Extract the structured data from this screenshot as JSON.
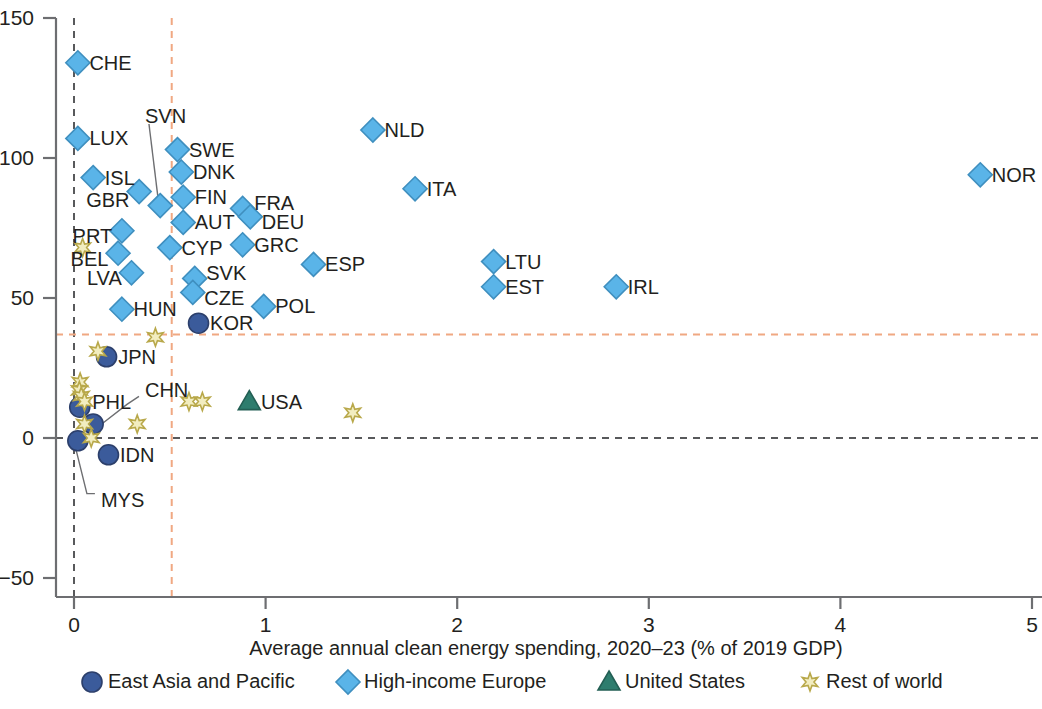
{
  "chart_data": {
    "type": "scatter",
    "title": "",
    "xlabel": "Average annual clean energy spending, 2020–23 (% of 2019 GDP)",
    "ylabel": "",
    "xlim": [
      0,
      5
    ],
    "ylim": [
      -50,
      150
    ],
    "xticks": [
      "0",
      "1",
      "2",
      "3",
      "4",
      "5"
    ],
    "xtick_values": [
      0,
      1,
      2,
      3,
      4,
      5
    ],
    "yticks": [
      "−50",
      "0",
      "50",
      "100",
      "150"
    ],
    "ytick_values": [
      -50,
      0,
      50,
      100,
      150
    ],
    "grid": false,
    "reference_lines": [
      {
        "name": "x-zero-dashed",
        "orientation": "vertical",
        "value": 0.0,
        "color": "#58595b",
        "style": "dashed"
      },
      {
        "name": "y-zero-dashed",
        "orientation": "horizontal",
        "value": 0,
        "color": "#58595b",
        "style": "dashed"
      },
      {
        "name": "x-median-dashed",
        "orientation": "vertical",
        "value": 0.51,
        "color": "#f0a882",
        "style": "dashed"
      },
      {
        "name": "y-median-dashed",
        "orientation": "horizontal",
        "value": 37,
        "color": "#f0a882",
        "style": "dashed"
      }
    ],
    "legend_position": "bottom",
    "series": [
      {
        "name": "East Asia and Pacific",
        "marker": "circle",
        "color": "#3b5b9b",
        "points": [
          {
            "label": "KOR",
            "x": 0.65,
            "y": 41,
            "lx": 0.7,
            "ly": 41,
            "anchor": "left"
          },
          {
            "label": "JPN",
            "x": 0.17,
            "y": 29,
            "lx": 0.22,
            "ly": 29,
            "anchor": "left"
          },
          {
            "label": "PHL",
            "x": 0.03,
            "y": 11,
            "lx": 0.085,
            "ly": 13,
            "anchor": "left"
          },
          {
            "label": "CHN",
            "x": 0.1,
            "y": 5,
            "lx": 0.36,
            "ly": 17,
            "anchor": "left",
            "leader": true
          },
          {
            "label": "MYS",
            "x": 0.02,
            "y": -1,
            "lx": 0.13,
            "ly": -22,
            "anchor": "left",
            "leader": true
          },
          {
            "label": "IDN",
            "x": 0.18,
            "y": -6,
            "lx": 0.23,
            "ly": -6,
            "anchor": "left"
          }
        ]
      },
      {
        "name": "High-income Europe",
        "marker": "diamond",
        "color": "#5ab4e8",
        "points": [
          {
            "label": "CHE",
            "x": 0.02,
            "y": 134,
            "lx": 0.07,
            "ly": 134,
            "anchor": "left"
          },
          {
            "label": "NOR",
            "x": 4.73,
            "y": 94,
            "lx": 4.78,
            "ly": 94,
            "anchor": "left"
          },
          {
            "label": "NLD",
            "x": 1.56,
            "y": 110,
            "lx": 1.61,
            "ly": 110,
            "anchor": "left"
          },
          {
            "label": "LUX",
            "x": 0.02,
            "y": 107,
            "lx": 0.07,
            "ly": 107,
            "anchor": "left"
          },
          {
            "label": "SWE",
            "x": 0.54,
            "y": 103,
            "lx": 0.59,
            "ly": 103,
            "anchor": "left"
          },
          {
            "label": "DNK",
            "x": 0.56,
            "y": 95,
            "lx": 0.61,
            "ly": 95,
            "anchor": "left"
          },
          {
            "label": "ISL",
            "x": 0.1,
            "y": 93,
            "lx": 0.15,
            "ly": 93,
            "anchor": "left"
          },
          {
            "label": "ITA",
            "x": 1.78,
            "y": 89,
            "lx": 1.83,
            "ly": 89,
            "anchor": "left"
          },
          {
            "label": "GBR",
            "x": 0.34,
            "y": 88,
            "lx": 0.3,
            "ly": 85,
            "anchor": "right"
          },
          {
            "label": "FIN",
            "x": 0.57,
            "y": 86,
            "lx": 0.62,
            "ly": 86,
            "anchor": "left"
          },
          {
            "label": "SVN",
            "x": 0.45,
            "y": 83,
            "lx": 0.36,
            "ly": 115,
            "anchor": "left",
            "leader": true
          },
          {
            "label": "FRA",
            "x": 0.88,
            "y": 82,
            "lx": 0.93,
            "ly": 84,
            "anchor": "left"
          },
          {
            "label": "DEU",
            "x": 0.92,
            "y": 79,
            "lx": 0.97,
            "ly": 77,
            "anchor": "left"
          },
          {
            "label": "AUT",
            "x": 0.57,
            "y": 77,
            "lx": 0.62,
            "ly": 77,
            "anchor": "left"
          },
          {
            "label": "PRT",
            "x": 0.25,
            "y": 74,
            "lx": 0.21,
            "ly": 72,
            "anchor": "right"
          },
          {
            "label": "GRC",
            "x": 0.88,
            "y": 69,
            "lx": 0.93,
            "ly": 69,
            "anchor": "left"
          },
          {
            "label": "CYP",
            "x": 0.5,
            "y": 68,
            "lx": 0.55,
            "ly": 68,
            "anchor": "left"
          },
          {
            "label": "BEL",
            "x": 0.23,
            "y": 66,
            "lx": 0.19,
            "ly": 64,
            "anchor": "right"
          },
          {
            "label": "ESP",
            "x": 1.25,
            "y": 62,
            "lx": 1.3,
            "ly": 62,
            "anchor": "left"
          },
          {
            "label": "LTU",
            "x": 2.19,
            "y": 63,
            "lx": 2.24,
            "ly": 63,
            "anchor": "left"
          },
          {
            "label": "LVA",
            "x": 0.3,
            "y": 59,
            "lx": 0.26,
            "ly": 57,
            "anchor": "right"
          },
          {
            "label": "SVK",
            "x": 0.63,
            "y": 57,
            "lx": 0.68,
            "ly": 59,
            "anchor": "left"
          },
          {
            "label": "CZE",
            "x": 0.62,
            "y": 52,
            "lx": 0.67,
            "ly": 50,
            "anchor": "left"
          },
          {
            "label": "EST",
            "x": 2.19,
            "y": 54,
            "lx": 2.24,
            "ly": 54,
            "anchor": "left"
          },
          {
            "label": "IRL",
            "x": 2.83,
            "y": 54,
            "lx": 2.88,
            "ly": 54,
            "anchor": "left"
          },
          {
            "label": "POL",
            "x": 0.99,
            "y": 47,
            "lx": 1.04,
            "ly": 47,
            "anchor": "left"
          },
          {
            "label": "HUN",
            "x": 0.25,
            "y": 46,
            "lx": 0.3,
            "ly": 46,
            "anchor": "left"
          }
        ]
      },
      {
        "name": "United States",
        "marker": "triangle",
        "color": "#2e7d6e",
        "points": [
          {
            "label": "USA",
            "x": 0.915,
            "y": 13,
            "lx": 0.965,
            "ly": 13,
            "anchor": "left"
          }
        ]
      },
      {
        "name": "Rest of world",
        "marker": "star",
        "color": "#f2edc0",
        "points": [
          {
            "label": "",
            "x": 0.045,
            "y": 68
          },
          {
            "label": "",
            "x": 0.425,
            "y": 36
          },
          {
            "label": "",
            "x": 0.125,
            "y": 31
          },
          {
            "label": "",
            "x": 0.032,
            "y": 20
          },
          {
            "label": "",
            "x": 0.028,
            "y": 17
          },
          {
            "label": "",
            "x": 0.038,
            "y": 15
          },
          {
            "label": "",
            "x": 0.055,
            "y": 13
          },
          {
            "label": "",
            "x": 0.6,
            "y": 13
          },
          {
            "label": "",
            "x": 0.67,
            "y": 13
          },
          {
            "label": "",
            "x": 1.455,
            "y": 9
          },
          {
            "label": "",
            "x": 0.055,
            "y": 5
          },
          {
            "label": "",
            "x": 0.33,
            "y": 5
          },
          {
            "label": "",
            "x": 0.09,
            "y": 0
          }
        ]
      }
    ]
  },
  "legend": {
    "items": [
      {
        "label": "East Asia and Pacific",
        "marker": "circle",
        "color": "#3b5b9b"
      },
      {
        "label": "High-income Europe",
        "marker": "diamond",
        "color": "#5ab4e8"
      },
      {
        "label": "United States",
        "marker": "triangle",
        "color": "#2e7d6e"
      },
      {
        "label": "Rest of world",
        "marker": "star",
        "color": "#f2edc0"
      }
    ]
  }
}
